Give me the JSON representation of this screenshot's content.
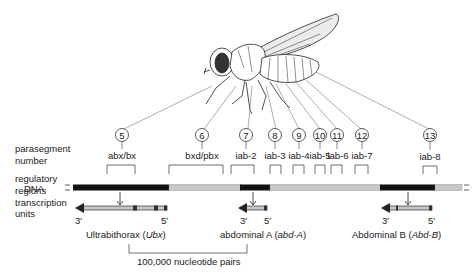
{
  "row_labels": {
    "parasegment_1": "parasegment",
    "parasegment_2": "number",
    "regulatory_1": "regulatory",
    "regulatory_2": "regions",
    "dna": "DNA",
    "transcription_1": "transcription",
    "transcription_2": "units"
  },
  "parasegments": [
    {
      "number": "5",
      "region": "abx/bx"
    },
    {
      "number": "6",
      "region": "bxd/pbx"
    },
    {
      "number": "7",
      "region": "iab-2"
    },
    {
      "number": "8",
      "region": "iab-3"
    },
    {
      "number": "9",
      "region": "iab-4"
    },
    {
      "number": "10",
      "region": "iab-5"
    },
    {
      "number": "11",
      "region": "iab-6"
    },
    {
      "number": "12",
      "region": "iab-7"
    },
    {
      "number": "13",
      "region": "iab-8"
    }
  ],
  "genes": [
    {
      "name": "Ultrabithorax",
      "abbrev": "Ubx",
      "end3": "3′",
      "end5": "5′"
    },
    {
      "name": "abdominal A",
      "abbrev": "abd-A",
      "end3": "3′",
      "end5": "5′"
    },
    {
      "name": "Abdominal B",
      "abbrev": "Abd-B",
      "end3": "3′",
      "end5": "5′"
    }
  ],
  "scale_bar": {
    "label": "100,000 nucleotide pairs"
  },
  "colors": {
    "dna_black": "#111111",
    "dna_gray": "#c8c8c8",
    "line": "#555555",
    "text": "#222222"
  }
}
